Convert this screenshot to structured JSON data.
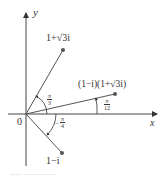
{
  "diagram": {
    "type": "complex-plane",
    "axes": {
      "x_label": "x",
      "y_label": "y",
      "origin_label": "0"
    },
    "points": [
      {
        "label": "1+√3i",
        "angle_label": "π/3",
        "angle_num": "π",
        "angle_den": "3"
      },
      {
        "label": "(1−i)(1+√3i)",
        "angle_label": "π/12",
        "angle_num": "π",
        "angle_den": "12"
      },
      {
        "label": "1−i",
        "angle_label": "−π/4",
        "angle_num": "π",
        "angle_den": "4",
        "angle_sign": "−"
      }
    ],
    "caption": "—— ——————"
  },
  "colors": {
    "line": "#555555",
    "text": "#333333"
  }
}
